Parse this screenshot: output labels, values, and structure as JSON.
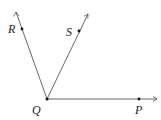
{
  "diagram": {
    "vertex": {
      "name": "Q",
      "label": "Q"
    },
    "rays": [
      {
        "id": "QR",
        "point_label": "R"
      },
      {
        "id": "QS",
        "point_label": "S"
      },
      {
        "id": "QP",
        "point_label": "P"
      }
    ],
    "labels": {
      "R": "R",
      "S": "S",
      "Q": "Q",
      "P": "P"
    }
  }
}
